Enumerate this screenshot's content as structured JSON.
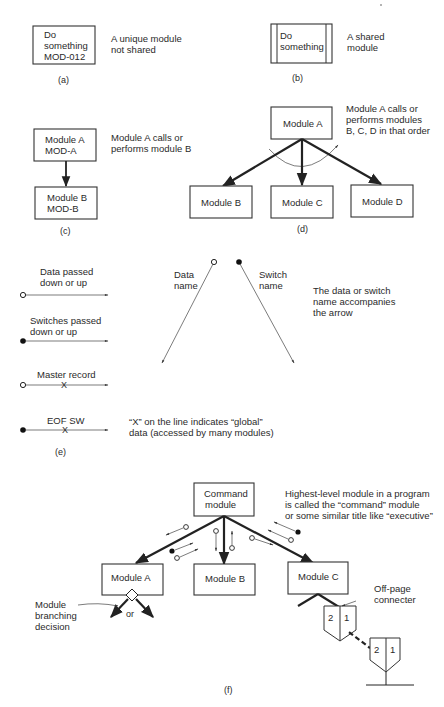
{
  "sections": {
    "a": {
      "caption": "(a)",
      "box_lines": [
        "Do",
        "something",
        "MOD-012"
      ],
      "description": [
        "A unique module",
        "not shared"
      ]
    },
    "b": {
      "caption": "(b)",
      "box_lines": [
        "Do",
        "something"
      ],
      "description": [
        "A shared",
        "module"
      ]
    },
    "c": {
      "caption": "(c)",
      "top_box": [
        "Module A",
        "MOD-A"
      ],
      "bottom_box": [
        "Module B",
        "MOD-B"
      ],
      "description": [
        "Module A calls or",
        "performs module B"
      ]
    },
    "d": {
      "caption": "(d)",
      "parent": "Module A",
      "children": [
        "Module B",
        "Module C",
        "Module D"
      ],
      "description": [
        "Module A calls or",
        "performs modules",
        "B, C, D in that order"
      ]
    },
    "e": {
      "caption": "(e)",
      "legend": [
        {
          "label": [
            "Data passed",
            "down or up"
          ],
          "marker": "open-circle",
          "global": false
        },
        {
          "label": [
            "Switches passed",
            "down or up"
          ],
          "marker": "filled-circle",
          "global": false
        },
        {
          "label": [
            "Master record"
          ],
          "marker": "open-circle",
          "global": true
        },
        {
          "label": [
            "EOF SW"
          ],
          "marker": "filled-circle",
          "global": true
        }
      ],
      "data_name": [
        "Data",
        "name"
      ],
      "switch_name": [
        "Switch",
        "name"
      ],
      "name_note": [
        "The data or switch",
        "name accompanies",
        "the arrow"
      ],
      "global_note": [
        "“X” on the line indicates “global”",
        "data (accessed by many modules)"
      ]
    },
    "f": {
      "caption": "(f)",
      "command": [
        "Command",
        "module"
      ],
      "modules": [
        "Module A",
        "Module B",
        "Module C"
      ],
      "command_note": [
        "Highest-level module in a program",
        "is called the “command” module",
        "or some similar title like “executive”"
      ],
      "branch_label": [
        "Module",
        "branching",
        "decision"
      ],
      "or_label": "or",
      "offpage_label": [
        "Off-page",
        "connecter"
      ],
      "connector_numbers": [
        "2",
        "1"
      ]
    }
  }
}
